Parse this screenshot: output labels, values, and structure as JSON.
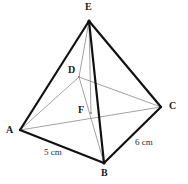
{
  "figure": {
    "background_color": "#ffffff",
    "edge_color_solid": "#111111",
    "edge_color_hidden": "#8a8a8a",
    "label_color": "#1a1a1a",
    "canvas": {
      "width": 188,
      "height": 184
    },
    "points": {
      "E": {
        "x": 89,
        "y": 21,
        "label": "E",
        "label_x": 85,
        "label_y": 2
      },
      "D": {
        "x": 79,
        "y": 77,
        "label": "D",
        "label_x": 68,
        "label_y": 65
      },
      "A": {
        "x": 20,
        "y": 130,
        "label": "A",
        "label_x": 6,
        "label_y": 125
      },
      "C": {
        "x": 161,
        "y": 107,
        "label": "C",
        "label_x": 169,
        "label_y": 101
      },
      "B": {
        "x": 104,
        "y": 163,
        "label": "B",
        "label_x": 101,
        "label_y": 168
      },
      "F": {
        "x": 91,
        "y": 113,
        "label": "F",
        "label_x": 78,
        "label_y": 105
      }
    },
    "edges_solid": [
      {
        "name": "edge-E-A",
        "from": "E",
        "to": "A"
      },
      {
        "name": "edge-E-C",
        "from": "E",
        "to": "C"
      },
      {
        "name": "edge-E-B",
        "from": "E",
        "to": "B"
      },
      {
        "name": "edge-A-B",
        "from": "A",
        "to": "B"
      },
      {
        "name": "edge-B-C",
        "from": "B",
        "to": "C"
      }
    ],
    "edges_hidden": [
      {
        "name": "edge-E-D",
        "from": "E",
        "to": "D"
      },
      {
        "name": "edge-A-D",
        "from": "A",
        "to": "D"
      },
      {
        "name": "edge-D-C",
        "from": "D",
        "to": "C"
      },
      {
        "name": "edge-A-C",
        "from": "A",
        "to": "C"
      },
      {
        "name": "edge-D-B",
        "from": "D",
        "to": "B"
      },
      {
        "name": "edge-E-F",
        "from": "E",
        "to": "F"
      }
    ],
    "measurements": [
      {
        "name": "length-AB",
        "text": "5 cm",
        "x": 44,
        "y": 148
      },
      {
        "name": "length-BC",
        "text": "6 cm",
        "x": 135,
        "y": 138
      }
    ]
  }
}
